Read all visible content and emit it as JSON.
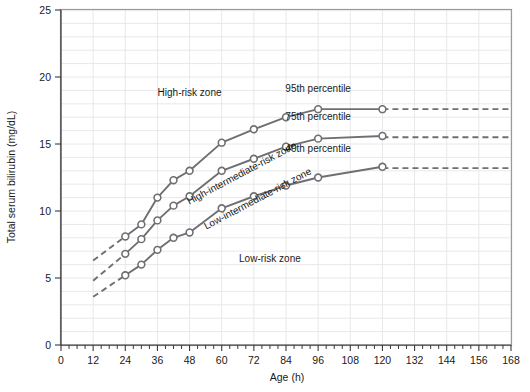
{
  "chart_data": {
    "type": "line",
    "title": "",
    "xlabel": "Age (h)",
    "ylabel": "Total serum bilirubin (mg/dL)",
    "xlim": [
      0,
      168
    ],
    "ylim": [
      0,
      25
    ],
    "xticks": [
      0,
      12,
      24,
      36,
      48,
      60,
      72,
      84,
      96,
      108,
      120,
      132,
      144,
      156,
      168
    ],
    "yticks": [
      0,
      5,
      10,
      15,
      20,
      25
    ],
    "xtick_labels": [
      "0",
      "12",
      "24",
      "36",
      "48",
      "60",
      "72",
      "84",
      "96",
      "108",
      "120",
      "132",
      "144",
      "156",
      "168"
    ],
    "ytick_labels": [
      "0",
      "5",
      "10",
      "15",
      "20",
      "25"
    ],
    "xtick_minor_step": 3,
    "ytick_minor_step": 1,
    "grid": true,
    "legend_position": "inline-annotations",
    "series": [
      {
        "name": "95th percentile",
        "label": "95th percentile",
        "x": [
          24,
          30,
          36,
          42,
          48,
          60,
          72,
          84,
          96,
          120
        ],
        "y": [
          8.1,
          9.0,
          11.0,
          12.3,
          13.0,
          15.1,
          16.1,
          17.0,
          17.6,
          17.6
        ],
        "dashed_lead_in": {
          "x": [
            12,
            24
          ],
          "y": [
            6.3,
            8.1
          ]
        },
        "dashed_tail": {
          "x": [
            120,
            168
          ],
          "y": [
            17.6,
            17.6
          ]
        },
        "label_x": 96,
        "label_y": 18.9
      },
      {
        "name": "75th percentile",
        "label": "75th percentile",
        "x": [
          24,
          30,
          36,
          42,
          48,
          60,
          72,
          84,
          96,
          120
        ],
        "y": [
          6.8,
          7.9,
          9.3,
          10.4,
          11.1,
          13.0,
          13.9,
          14.8,
          15.4,
          15.6
        ],
        "dashed_lead_in": {
          "x": [
            12,
            24
          ],
          "y": [
            4.8,
            6.8
          ]
        },
        "dashed_tail": {
          "x": [
            120,
            168
          ],
          "y": [
            15.5,
            15.5
          ]
        },
        "label_x": 96,
        "label_y": 16.8
      },
      {
        "name": "40th percentile",
        "label": "40th percentile",
        "x": [
          24,
          30,
          36,
          42,
          48,
          60,
          72,
          84,
          96,
          120
        ],
        "y": [
          5.2,
          6.0,
          7.1,
          8.0,
          8.4,
          10.2,
          11.1,
          11.9,
          12.5,
          13.3
        ],
        "dashed_lead_in": {
          "x": [
            12,
            24
          ],
          "y": [
            3.6,
            5.2
          ]
        },
        "dashed_tail": {
          "x": [
            120,
            168
          ],
          "y": [
            13.2,
            13.2
          ]
        },
        "label_x": 96,
        "label_y": 14.4
      }
    ],
    "zone_labels": [
      {
        "text": "High-risk zone",
        "x": 48,
        "y": 18.6,
        "rotation": 0
      },
      {
        "text": "High-intermediate-risk zone",
        "x": 68,
        "y": 12.6,
        "rotation": -28
      },
      {
        "text": "Low-intermediate-risk zone",
        "x": 74,
        "y": 10.7,
        "rotation": -28
      },
      {
        "text": "Low-risk zone",
        "x": 78,
        "y": 6.2,
        "rotation": 0
      }
    ]
  },
  "colors": {
    "curve": "#6f6f73",
    "grid": "#e8e8ea",
    "axis": "#3a3a3a",
    "frame": "#9a9a9e",
    "text": "#1a1a1a",
    "background": "#ffffff"
  }
}
